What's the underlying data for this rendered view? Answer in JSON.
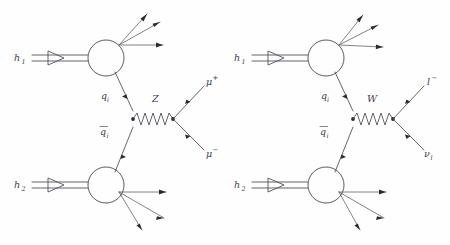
{
  "figure": {
    "kind": "feynman-diagram-pair",
    "background_color": "#fefefe",
    "line_color": "#4a4a52",
    "label_color": "#3c3c44"
  },
  "diagrams": [
    {
      "id": "neutral-current",
      "mediator": {
        "label": "Z",
        "propagator_style": "zigzag",
        "oscillations": 5
      },
      "incoming": [
        {
          "label": "h",
          "subscript": "1",
          "name": "hadron-1",
          "style": "double-line-with-hollow-arrow"
        },
        {
          "label": "h",
          "subscript": "2",
          "name": "hadron-2",
          "style": "double-line-with-hollow-arrow"
        }
      ],
      "partons": [
        {
          "label": "q",
          "subscript": "i",
          "overline": false,
          "name": "quark"
        },
        {
          "label": "q",
          "subscript": "i",
          "overline": true,
          "name": "antiquark"
        }
      ],
      "outgoing": [
        {
          "label": "μ",
          "superscript": "+",
          "name": "muon-plus"
        },
        {
          "label": "μ",
          "superscript": "−",
          "name": "muon-minus"
        }
      ],
      "jets": {
        "upper_count": 3,
        "lower_count": 3
      }
    },
    {
      "id": "charged-current",
      "mediator": {
        "label": "W",
        "propagator_style": "zigzag",
        "oscillations": 5
      },
      "incoming": [
        {
          "label": "h",
          "subscript": "1",
          "name": "hadron-1",
          "style": "double-line-with-hollow-arrow"
        },
        {
          "label": "h",
          "subscript": "2",
          "name": "hadron-2",
          "style": "double-line-with-hollow-arrow"
        }
      ],
      "partons": [
        {
          "label": "q",
          "subscript": "i",
          "overline": false,
          "name": "quark"
        },
        {
          "label": "q",
          "subscript": "i",
          "overline": true,
          "name": "antiquark"
        }
      ],
      "outgoing": [
        {
          "label": "l",
          "superscript": "−",
          "name": "lepton-minus"
        },
        {
          "label": "ν",
          "subscript": "l",
          "name": "neutrino"
        }
      ],
      "jets": {
        "upper_count": 3,
        "lower_count": 3
      }
    }
  ]
}
